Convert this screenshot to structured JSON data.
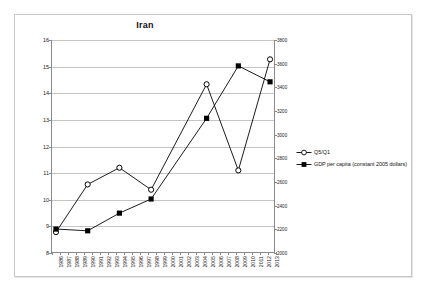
{
  "chart_data": {
    "type": "line",
    "title": "Iran",
    "xlabel": "",
    "ylabel": "",
    "grid": true,
    "legend_position": "right",
    "categories": [
      "1986",
      "1987",
      "1988",
      "1989",
      "1990",
      "1991",
      "1992",
      "1993",
      "1994",
      "1995",
      "1996",
      "1997",
      "1998",
      "1999",
      "2000",
      "2001",
      "2002",
      "2003",
      "2004",
      "2005",
      "2006",
      "2007",
      "2008",
      "2009",
      "2010",
      "2011",
      "2012",
      "2013"
    ],
    "y_left": {
      "label": "",
      "ticks": [
        8,
        9,
        10,
        11,
        12,
        13,
        14,
        15,
        16
      ],
      "ylim": [
        8,
        16
      ]
    },
    "y_right": {
      "label": "",
      "ticks": [
        2000,
        2200,
        2400,
        2600,
        2800,
        3000,
        3200,
        3400,
        3600,
        3800
      ],
      "ylim": [
        2000,
        3800
      ]
    },
    "series": [
      {
        "name": "Q5/Q1",
        "axis": "left",
        "marker": "open-circle",
        "color": "#000000",
        "points": [
          {
            "x": "1986",
            "y": 8.75
          },
          {
            "x": "1990",
            "y": 10.55
          },
          {
            "x": "1994",
            "y": 11.18
          },
          {
            "x": "1998",
            "y": 10.35
          },
          {
            "x": "2005",
            "y": 14.33
          },
          {
            "x": "2009",
            "y": 11.08
          },
          {
            "x": "2013",
            "y": 15.27
          }
        ]
      },
      {
        "name": "GDP per capita (constant 2005 dollars)",
        "axis": "right",
        "marker": "filled-square",
        "color": "#000000",
        "points": [
          {
            "x": "1986",
            "y": 2195
          },
          {
            "x": "1990",
            "y": 2180
          },
          {
            "x": "1994",
            "y": 2330
          },
          {
            "x": "1998",
            "y": 2450
          },
          {
            "x": "2005",
            "y": 3135
          },
          {
            "x": "2009",
            "y": 3580
          },
          {
            "x": "2013",
            "y": 3445
          }
        ]
      }
    ]
  },
  "legend": {
    "items": [
      {
        "label": "Q5/Q1",
        "marker": "open-circle"
      },
      {
        "label": "GDP per capita (constant 2005 dollars)",
        "marker": "filled-square"
      }
    ]
  }
}
